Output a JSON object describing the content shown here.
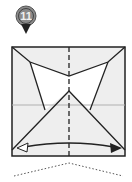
{
  "step": {
    "number": "11",
    "marker_color": "#8a8a8a",
    "marker_ring": "#555555"
  },
  "diagram": {
    "paper_color": "#eeeeee",
    "flap_color": "#ffffff",
    "line_color": "#222222",
    "crease_color": "#b0b0b0",
    "center_line_style": "dashed",
    "arrow": "double-headed-curved",
    "bottom_guide": "dotted-valley"
  }
}
